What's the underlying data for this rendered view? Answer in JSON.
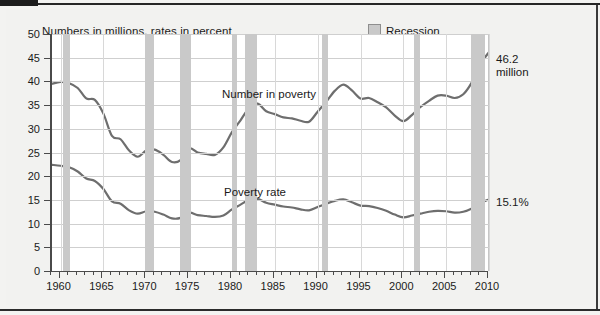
{
  "subtitle": "Numbers in millions, rates in percent",
  "legend": {
    "swatch_name": "recession-swatch",
    "label": "Recession",
    "color": "#c9c9c9"
  },
  "series_labels": {
    "number": "Number in poverty",
    "rate": "Poverty rate"
  },
  "end_labels": {
    "number_line1": "46.2",
    "number_line2": "million",
    "rate": "15.1%"
  },
  "axes": {
    "y_ticks": [
      "0",
      "5",
      "10",
      "15",
      "20",
      "25",
      "30",
      "35",
      "40",
      "45",
      "50"
    ],
    "y_min": 0,
    "y_max": 50,
    "x_ticks": [
      "1960",
      "1965",
      "1970",
      "1975",
      "1980",
      "1985",
      "1990",
      "1995",
      "2000",
      "2005",
      "2010"
    ],
    "x_min": 1959,
    "x_max": 2010
  },
  "chart_data": {
    "type": "line",
    "title": "",
    "subtitle": "Numbers in millions, rates in percent",
    "xlabel": "",
    "ylabel": "",
    "xlim": [
      1959,
      2010
    ],
    "ylim": [
      0,
      50
    ],
    "grid": "horizontal",
    "legend_position": "top-right",
    "line_color": "#6e6e6e",
    "recession_color": "#c9c9c9",
    "x": [
      1959,
      1960,
      1961,
      1962,
      1963,
      1964,
      1965,
      1966,
      1967,
      1968,
      1969,
      1970,
      1971,
      1972,
      1973,
      1974,
      1975,
      1976,
      1977,
      1978,
      1979,
      1980,
      1981,
      1982,
      1983,
      1984,
      1985,
      1986,
      1987,
      1988,
      1989,
      1990,
      1991,
      1992,
      1993,
      1994,
      1995,
      1996,
      1997,
      1998,
      1999,
      2000,
      2001,
      2002,
      2003,
      2004,
      2005,
      2006,
      2007,
      2008,
      2009,
      2010
    ],
    "series": [
      {
        "name": "Number in poverty",
        "units": "millions",
        "end_label": "46.2 million",
        "values": [
          39.5,
          39.9,
          39.6,
          38.6,
          36.4,
          36.1,
          33.2,
          28.5,
          27.8,
          25.4,
          24.1,
          25.4,
          25.6,
          24.5,
          23.0,
          23.4,
          25.9,
          25.0,
          24.7,
          24.5,
          26.1,
          29.3,
          31.8,
          34.4,
          35.3,
          33.7,
          33.1,
          32.4,
          32.2,
          31.7,
          31.5,
          33.6,
          35.7,
          38.0,
          39.3,
          38.1,
          36.4,
          36.5,
          35.6,
          34.5,
          32.8,
          31.6,
          32.9,
          34.6,
          35.9,
          37.0,
          37.0,
          36.5,
          37.3,
          39.8,
          43.6,
          46.2
        ]
      },
      {
        "name": "Poverty rate",
        "units": "percent",
        "end_label": "15.1%",
        "values": [
          22.4,
          22.2,
          21.9,
          21.0,
          19.5,
          19.0,
          17.3,
          14.7,
          14.2,
          12.8,
          12.1,
          12.6,
          12.5,
          11.9,
          11.1,
          11.2,
          12.3,
          11.8,
          11.6,
          11.4,
          11.7,
          13.0,
          14.0,
          15.0,
          15.2,
          14.4,
          14.0,
          13.6,
          13.4,
          13.0,
          12.8,
          13.5,
          14.2,
          14.8,
          15.1,
          14.5,
          13.8,
          13.7,
          13.3,
          12.7,
          11.9,
          11.3,
          11.7,
          12.1,
          12.5,
          12.7,
          12.6,
          12.3,
          12.5,
          13.2,
          14.3,
          15.1
        ]
      }
    ],
    "recessions": [
      {
        "start": 1960.3,
        "end": 1961.1
      },
      {
        "start": 1969.9,
        "end": 1970.9
      },
      {
        "start": 1973.9,
        "end": 1975.2
      },
      {
        "start": 1980.0,
        "end": 1980.6
      },
      {
        "start": 1981.5,
        "end": 1982.9
      },
      {
        "start": 1990.5,
        "end": 1991.2
      },
      {
        "start": 2001.2,
        "end": 2001.9
      },
      {
        "start": 2007.9,
        "end": 2009.5
      }
    ]
  }
}
